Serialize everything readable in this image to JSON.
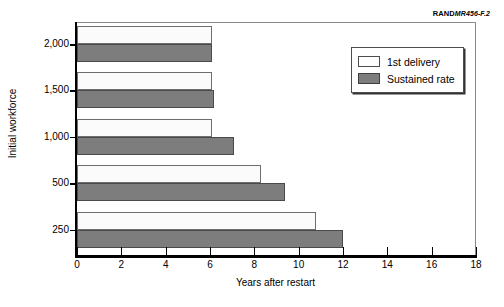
{
  "source_credit": {
    "rand_mark": "RAND",
    "doc_id": "MR456-F.2"
  },
  "legend": {
    "items": [
      {
        "label": "1st delivery",
        "swatch": "white-outlined-square",
        "color": "#ffffff"
      },
      {
        "label": "Sustained rate",
        "swatch": "gray-filled-square",
        "color": "#7d7d7d"
      }
    ]
  },
  "axes": {
    "x": {
      "label": "Years after restart",
      "ticks": [
        "0",
        "2",
        "4",
        "6",
        "8",
        "10",
        "12",
        "14",
        "16",
        "18"
      ],
      "min": 0,
      "max": 18
    },
    "y": {
      "label": "Initial workforce",
      "ticks": [
        "2,000",
        "1,500",
        "1,000",
        "500",
        "250"
      ]
    }
  },
  "chart_data": {
    "type": "bar",
    "orientation": "horizontal",
    "title": "",
    "xlabel": "Years after restart",
    "ylabel": "Initial workforce",
    "xlim": [
      0,
      18
    ],
    "grid": false,
    "legend_position": "top-right-inside",
    "categories": [
      "2,000",
      "1,500",
      "1,000",
      "500",
      "250"
    ],
    "series": [
      {
        "name": "1st delivery",
        "color": "#ffffff",
        "values": [
          6.1,
          6.1,
          6.1,
          8.3,
          10.8
        ]
      },
      {
        "name": "Sustained rate",
        "color": "#7d7d7d",
        "values": [
          6.1,
          6.2,
          7.1,
          9.4,
          12.0
        ]
      }
    ]
  }
}
